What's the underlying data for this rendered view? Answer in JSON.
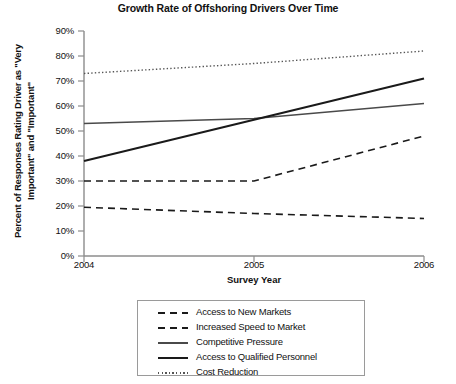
{
  "chart_data": {
    "type": "line",
    "title": "Growth Rate of Offshoring Drivers Over Time",
    "xlabel": "Survey Year",
    "ylabel": "Percent of Responses Rating Driver as \"Very Important\" and \"Important\"",
    "categories": [
      "2004",
      "2005",
      "2006"
    ],
    "x": [
      2004,
      2005,
      2006
    ],
    "xlim": [
      2004,
      2006
    ],
    "ylim": [
      0,
      90
    ],
    "ytick_labels": [
      "0%",
      "10%",
      "20%",
      "30%",
      "40%",
      "50%",
      "60%",
      "70%",
      "80%",
      "90%"
    ],
    "ytick_values": [
      0,
      10,
      20,
      30,
      40,
      50,
      60,
      70,
      80,
      90
    ],
    "grid": false,
    "legend_position": "below-plot",
    "series": [
      {
        "name": "Access to New Markets",
        "values": [
          30,
          30,
          48
        ],
        "style": "dashed",
        "color": "#1a1a1a",
        "width": 1.6
      },
      {
        "name": "Increased Speed to Market",
        "values": [
          19.5,
          17,
          15
        ],
        "style": "dashed",
        "color": "#1a1a1a",
        "width": 1.6
      },
      {
        "name": "Competitive Pressure",
        "values": [
          53,
          55,
          61
        ],
        "style": "solid",
        "color": "#4a4a4a",
        "width": 1.4
      },
      {
        "name": "Access to Qualified Personnel",
        "values": [
          38,
          54.5,
          71
        ],
        "style": "solid",
        "color": "#1a1a1a",
        "width": 2.0
      },
      {
        "name": "Cost Reduction",
        "values": [
          73,
          77,
          82
        ],
        "style": "dotted",
        "color": "#555555",
        "width": 1.4
      }
    ]
  },
  "axes": {
    "axis_color": "#8c8c8c",
    "plot_left": 84,
    "plot_right": 424,
    "plot_top": 31,
    "plot_bottom": 256
  }
}
